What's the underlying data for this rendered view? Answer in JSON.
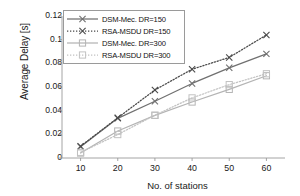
{
  "chart_data": {
    "type": "line",
    "title": "",
    "xlabel": "No. of stations",
    "ylabel": "Average Delay [s]",
    "x": [
      10,
      20,
      30,
      40,
      50,
      60
    ],
    "xlim": [
      5,
      65
    ],
    "ylim": [
      0,
      0.12
    ],
    "xticks": [
      10,
      20,
      30,
      40,
      50,
      60
    ],
    "yticks": [
      0,
      0.02,
      0.04,
      0.06,
      0.08,
      0.1,
      0.12
    ],
    "ytick_labels": [
      "0",
      "0.02",
      "0.04",
      "0.06",
      "0.08",
      "0.1",
      "0.12"
    ],
    "xtick_labels": [
      "10",
      "20",
      "30",
      "40",
      "50",
      "60"
    ],
    "grid": false,
    "legend_position": "upper-left",
    "series": [
      {
        "name": "DSM-Mec. DR=150",
        "values": [
          0.0095,
          0.0335,
          0.048,
          0.063,
          0.0762,
          0.088
        ],
        "color": "#707070",
        "line_style": "solid",
        "marker": "x"
      },
      {
        "name": "RSA-MSDU DR=150",
        "values": [
          0.01,
          0.034,
          0.0575,
          0.075,
          0.085,
          0.104
        ],
        "color": "#4a4a4a",
        "line_style": "dotted",
        "marker": "x"
      },
      {
        "name": "DSM-Mec. DR=300",
        "values": [
          0.0042,
          0.0228,
          0.036,
          0.0473,
          0.058,
          0.0695
        ],
        "color": "#b4b4b4",
        "line_style": "solid",
        "marker": "square"
      },
      {
        "name": "RSA-MSDU DR=300",
        "values": [
          0.0048,
          0.0198,
          0.0362,
          0.0508,
          0.062,
          0.0712
        ],
        "color": "#c2c2c2",
        "line_style": "dotted",
        "marker": "square"
      }
    ]
  },
  "axis": {
    "color": "#9a9a9a"
  }
}
